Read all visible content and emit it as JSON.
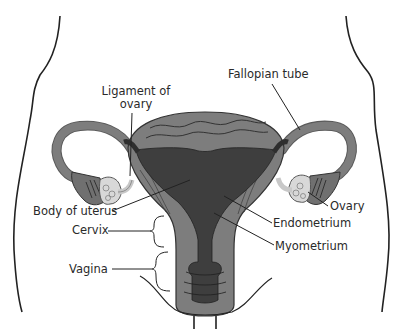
{
  "colors": {
    "outline": "#222222",
    "myometrium": "#7a7a7a",
    "myometrium_light": "#8c8c8c",
    "endometrium": "#3e3e3e",
    "tube": "#7d7d7d",
    "ovary": "#d6d6d6",
    "ligament": "#cfcfcf",
    "label_text": "#2a2a2a",
    "background": "#ffffff"
  },
  "labels": {
    "ligament_of_ovary": {
      "line1": "Ligament of",
      "line2": "ovary"
    },
    "fallopian_tube": "Fallopian tube",
    "body_of_uterus": "Body of uterus",
    "cervix": "Cervix",
    "vagina": "Vagina",
    "ovary": "Ovary",
    "endometrium": "Endometrium",
    "myometrium": "Myometrium"
  }
}
